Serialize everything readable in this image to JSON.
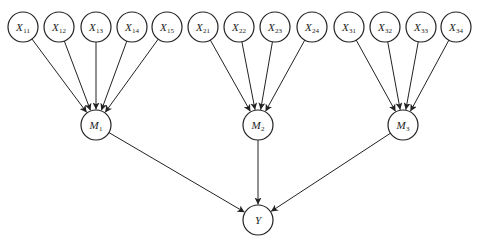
{
  "diagram": {
    "type": "directed-graph",
    "width": 478,
    "height": 244,
    "node_radius": 15,
    "colors": {
      "stroke": "#222222",
      "fill": "#ffffff",
      "text": "#222222",
      "background": "#ffffff"
    },
    "nodes": [
      {
        "id": "X11",
        "base": "X",
        "sub": "11",
        "x": 23,
        "y": 27
      },
      {
        "id": "X12",
        "base": "X",
        "sub": "12",
        "x": 59,
        "y": 27
      },
      {
        "id": "X13",
        "base": "X",
        "sub": "13",
        "x": 96,
        "y": 27
      },
      {
        "id": "X14",
        "base": "X",
        "sub": "14",
        "x": 132,
        "y": 27
      },
      {
        "id": "X15",
        "base": "X",
        "sub": "15",
        "x": 167,
        "y": 27
      },
      {
        "id": "X21",
        "base": "X",
        "sub": "21",
        "x": 203,
        "y": 27
      },
      {
        "id": "X22",
        "base": "X",
        "sub": "22",
        "x": 239,
        "y": 27
      },
      {
        "id": "X23",
        "base": "X",
        "sub": "23",
        "x": 275,
        "y": 27
      },
      {
        "id": "X24",
        "base": "X",
        "sub": "24",
        "x": 312,
        "y": 27
      },
      {
        "id": "X31",
        "base": "X",
        "sub": "31",
        "x": 349,
        "y": 27
      },
      {
        "id": "X32",
        "base": "X",
        "sub": "32",
        "x": 385,
        "y": 27
      },
      {
        "id": "X33",
        "base": "X",
        "sub": "33",
        "x": 421,
        "y": 27
      },
      {
        "id": "X34",
        "base": "X",
        "sub": "34",
        "x": 456,
        "y": 27
      },
      {
        "id": "M1",
        "base": "M",
        "sub": "1",
        "x": 96,
        "y": 125
      },
      {
        "id": "M2",
        "base": "M",
        "sub": "2",
        "x": 258,
        "y": 125
      },
      {
        "id": "M3",
        "base": "M",
        "sub": "3",
        "x": 403,
        "y": 125
      },
      {
        "id": "Y",
        "base": "Y",
        "sub": "",
        "x": 258,
        "y": 220
      }
    ],
    "edges": [
      {
        "from": "X11",
        "to": "M1"
      },
      {
        "from": "X12",
        "to": "M1"
      },
      {
        "from": "X13",
        "to": "M1"
      },
      {
        "from": "X14",
        "to": "M1"
      },
      {
        "from": "X15",
        "to": "M1"
      },
      {
        "from": "X21",
        "to": "M2"
      },
      {
        "from": "X22",
        "to": "M2"
      },
      {
        "from": "X23",
        "to": "M2"
      },
      {
        "from": "X24",
        "to": "M2"
      },
      {
        "from": "X31",
        "to": "M3"
      },
      {
        "from": "X32",
        "to": "M3"
      },
      {
        "from": "X33",
        "to": "M3"
      },
      {
        "from": "X34",
        "to": "M3"
      },
      {
        "from": "M1",
        "to": "Y"
      },
      {
        "from": "M2",
        "to": "Y"
      },
      {
        "from": "M3",
        "to": "Y"
      }
    ]
  }
}
